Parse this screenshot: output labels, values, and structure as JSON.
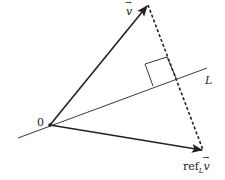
{
  "diagram": {
    "colors": {
      "stroke": "#222222",
      "background": "#ffffff"
    },
    "labels": {
      "v": "v",
      "line": "L",
      "origin": "0",
      "reflection_prefix": "ref",
      "reflection_sub": "L",
      "reflection_vec": "v"
    },
    "elements": [
      {
        "name": "vector-v",
        "from": [
          50,
          125
        ],
        "to": [
          148,
          5
        ],
        "style": "solid-arrow"
      },
      {
        "name": "vector-refLv",
        "from": [
          50,
          125
        ],
        "to": [
          203,
          150
        ],
        "style": "solid-arrow"
      },
      {
        "name": "line-L",
        "from": [
          18,
          138
        ],
        "to": [
          207,
          68
        ],
        "style": "solid-thin"
      },
      {
        "name": "perpendicular",
        "from": [
          148,
          5
        ],
        "to": [
          203,
          150
        ],
        "style": "dashed"
      },
      {
        "name": "right-angle-marker",
        "points": [
          [
            153,
            86
          ],
          [
            145,
            64
          ],
          [
            167,
            57
          ],
          [
            176,
            78
          ]
        ]
      }
    ]
  }
}
